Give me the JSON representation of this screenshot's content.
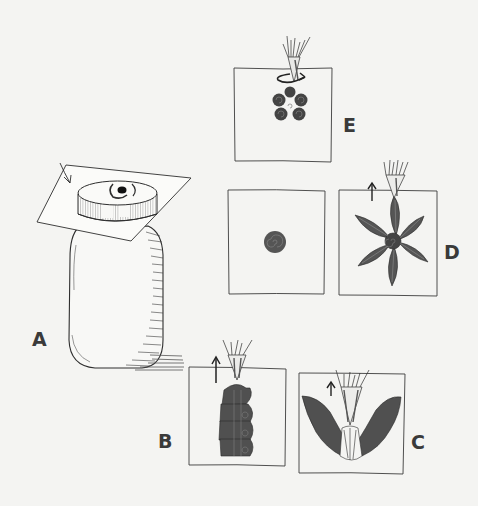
{
  "figure": {
    "colors": {
      "background": "#f4f4f2",
      "ink": "#2e2e2e",
      "icing": "#555555",
      "box_line": "#3c3c3c"
    },
    "panels": [
      {
        "id": "A",
        "label": "A",
        "subject": "Paper square placed on lid of a jar, arrow pointing at paper, dot of icing on lid"
      },
      {
        "id": "B",
        "label": "B",
        "subject": "Piping bag lifting up, column of ruffled icing, up arrow"
      },
      {
        "id": "C",
        "label": "C",
        "subject": "Piping bag lifting up from V-shaped ruffled icing with shell center, up arrow"
      },
      {
        "id": "D",
        "label": "D",
        "subject": "Six-petal icing flower with spiral center, piping bag lifting up, up arrow"
      },
      {
        "id": "E",
        "label": "E",
        "subject": "Five-petal spiral flower with rotating piping bag, circular arrow"
      },
      {
        "id": "dot",
        "label": "",
        "subject": "Square with single spiral icing dot"
      }
    ],
    "icons": [
      "arrow-down-right-icon",
      "arrow-up-icon",
      "rotate-arrow-icon",
      "piping-bag-icon"
    ]
  }
}
